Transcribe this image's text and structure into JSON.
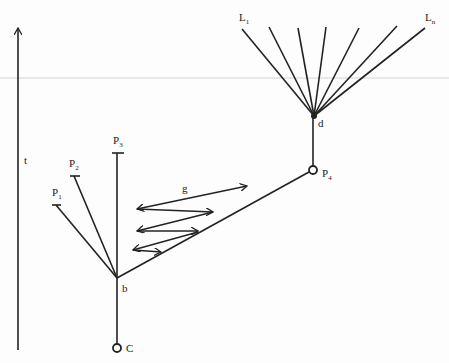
{
  "diagram": {
    "axis_label": "t",
    "labels": {
      "p1": {
        "main": "P",
        "sub": "1"
      },
      "p2": {
        "main": "P",
        "sub": "2"
      },
      "p3": {
        "main": "P",
        "sub": "3"
      },
      "p4": {
        "main": "P",
        "sub": "4"
      },
      "l1": {
        "main": "L",
        "sub": "1"
      },
      "ln": {
        "main": "L",
        "sub": "n"
      },
      "b": "b",
      "c": "C",
      "d": "d",
      "g": "g"
    },
    "line_color": "#222222"
  }
}
